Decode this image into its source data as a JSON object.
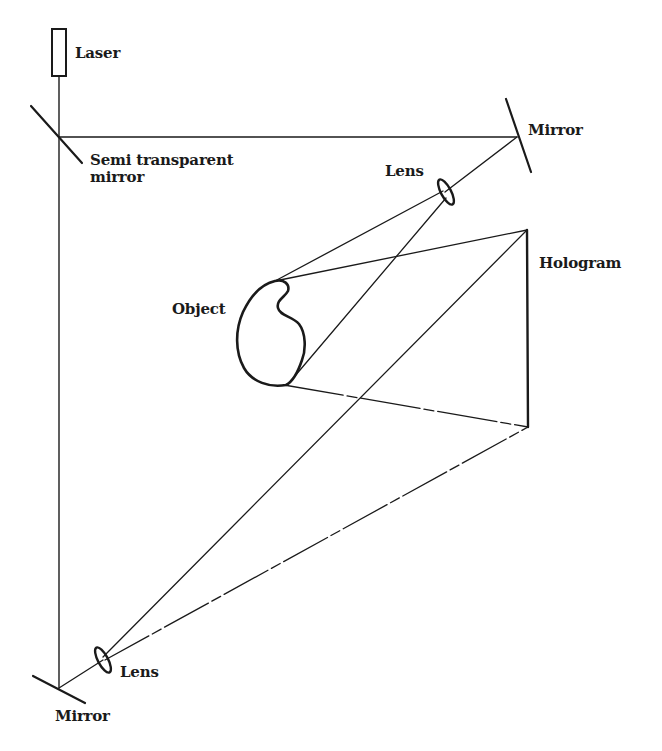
{
  "diagram": {
    "labels": {
      "laser": "Laser",
      "semi_mirror_line1": "Semi transparent",
      "semi_mirror_line2": "mirror",
      "mirror_top": "Mirror",
      "lens_top": "Lens",
      "hologram": "Hologram",
      "object": "Object",
      "lens_bottom": "Lens",
      "mirror_bottom": "Mirror"
    },
    "colors": {
      "ink": "#1a1a1a",
      "background": "#ffffff"
    },
    "components": [
      {
        "name": "laser",
        "type": "source"
      },
      {
        "name": "semi-transparent-mirror",
        "type": "beam-splitter"
      },
      {
        "name": "mirror-top",
        "type": "mirror"
      },
      {
        "name": "lens-top",
        "type": "lens"
      },
      {
        "name": "object",
        "type": "object"
      },
      {
        "name": "hologram",
        "type": "plate"
      },
      {
        "name": "mirror-bottom",
        "type": "mirror"
      },
      {
        "name": "lens-bottom",
        "type": "lens"
      }
    ]
  }
}
